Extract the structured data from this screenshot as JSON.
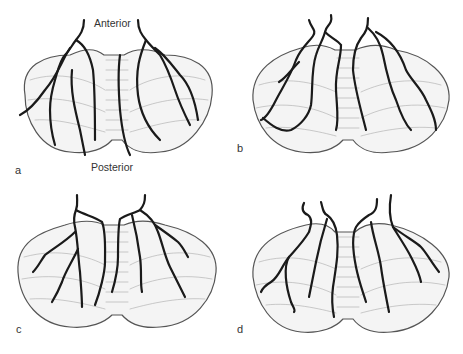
{
  "figure": {
    "orientation_labels": {
      "anterior": "Anterior",
      "posterior": "Posterior"
    },
    "panels": [
      {
        "id": "a",
        "label": "a"
      },
      {
        "id": "b",
        "label": "b"
      },
      {
        "id": "c",
        "label": "c"
      },
      {
        "id": "d",
        "label": "d"
      }
    ],
    "colors": {
      "vessel": "#1a1a1a",
      "outline": "#555555",
      "fill": "#f4f4f4",
      "folia": "#9a9a9a"
    }
  }
}
